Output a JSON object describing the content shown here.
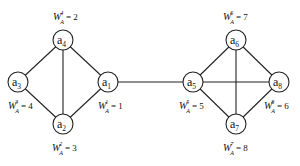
{
  "graph": {
    "nodes": [
      {
        "id": "a1",
        "base": "a",
        "sub": "1",
        "x": 108,
        "y": 82,
        "weight_sup": "1",
        "weight_sub": "A",
        "weight_value": "1",
        "label_x": 98,
        "label_y": 109
      },
      {
        "id": "a2",
        "base": "a",
        "sub": "2",
        "x": 63,
        "y": 124,
        "weight_sup": "2",
        "weight_sub": "A",
        "weight_value": "3",
        "label_x": 52,
        "label_y": 151
      },
      {
        "id": "a3",
        "base": "a",
        "sub": "3",
        "x": 18,
        "y": 82,
        "weight_sup": "3",
        "weight_sub": "A",
        "weight_value": "4",
        "label_x": 8,
        "label_y": 109
      },
      {
        "id": "a4",
        "base": "a",
        "sub": "4",
        "x": 63,
        "y": 40,
        "weight_sup": "4",
        "weight_sub": "A",
        "weight_value": "2",
        "label_x": 53,
        "label_y": 20
      },
      {
        "id": "a5",
        "base": "a",
        "sub": "5",
        "x": 193,
        "y": 82,
        "weight_sup": "5",
        "weight_sub": "A",
        "weight_value": "5",
        "label_x": 179,
        "label_y": 109
      },
      {
        "id": "a6",
        "base": "a",
        "sub": "6",
        "x": 236,
        "y": 40,
        "weight_sup": "6",
        "weight_sub": "A",
        "weight_value": "7",
        "label_x": 223,
        "label_y": 20
      },
      {
        "id": "a7",
        "base": "a",
        "sub": "7",
        "x": 236,
        "y": 124,
        "weight_sup": "7",
        "weight_sub": "A",
        "weight_value": "8",
        "label_x": 223,
        "label_y": 151
      },
      {
        "id": "a8",
        "base": "a",
        "sub": "8",
        "x": 279,
        "y": 82,
        "weight_sup": "8",
        "weight_sub": "A",
        "weight_value": "6",
        "label_x": 264,
        "label_y": 109
      }
    ],
    "edges": [
      [
        "a4",
        "a3"
      ],
      [
        "a4",
        "a1"
      ],
      [
        "a4",
        "a2"
      ],
      [
        "a3",
        "a2"
      ],
      [
        "a1",
        "a2"
      ],
      [
        "a1",
        "a5"
      ],
      [
        "a5",
        "a6"
      ],
      [
        "a5",
        "a7"
      ],
      [
        "a5",
        "a8"
      ],
      [
        "a6",
        "a7"
      ],
      [
        "a6",
        "a8"
      ],
      [
        "a7",
        "a8"
      ]
    ],
    "node_radius": 10,
    "weight_symbol": "W"
  }
}
